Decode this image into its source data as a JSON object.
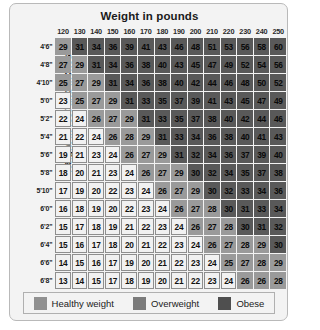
{
  "chart_data": {
    "type": "heatmap",
    "title": "Weight in pounds",
    "xlabel": "Weight in pounds",
    "ylabel": "Height in feet and inches",
    "grid": true,
    "legend_position": "bottom",
    "categories": [
      "120",
      "130",
      "140",
      "150",
      "160",
      "170",
      "180",
      "190",
      "200",
      "210",
      "220",
      "230",
      "240",
      "250"
    ],
    "rows": [
      "4'6\"",
      "4'8\"",
      "4'10\"",
      "5'0\"",
      "5'2\"",
      "5'4\"",
      "5'6\"",
      "5'8\"",
      "5'10\"",
      "6'0\"",
      "6'2\"",
      "6'4\"",
      "6'6\"",
      "6'8\""
    ],
    "series": [
      {
        "name": "4'6\"",
        "values": [
          29,
          31,
          34,
          36,
          39,
          41,
          43,
          46,
          48,
          51,
          53,
          56,
          58,
          60
        ]
      },
      {
        "name": "4'8\"",
        "values": [
          27,
          29,
          31,
          34,
          36,
          38,
          40,
          43,
          45,
          47,
          49,
          52,
          54,
          56
        ]
      },
      {
        "name": "4'10\"",
        "values": [
          25,
          27,
          29,
          31,
          34,
          36,
          38,
          40,
          42,
          44,
          46,
          48,
          50,
          52
        ]
      },
      {
        "name": "5'0\"",
        "values": [
          23,
          25,
          27,
          29,
          31,
          33,
          35,
          37,
          39,
          41,
          43,
          45,
          47,
          49
        ]
      },
      {
        "name": "5'2\"",
        "values": [
          22,
          24,
          26,
          27,
          29,
          31,
          33,
          35,
          37,
          38,
          40,
          42,
          44,
          46
        ]
      },
      {
        "name": "5'4\"",
        "values": [
          21,
          22,
          24,
          26,
          28,
          29,
          31,
          33,
          34,
          36,
          38,
          40,
          41,
          43
        ]
      },
      {
        "name": "5'6\"",
        "values": [
          19,
          21,
          23,
          24,
          26,
          27,
          29,
          31,
          32,
          34,
          36,
          37,
          39,
          40
        ]
      },
      {
        "name": "5'8\"",
        "values": [
          18,
          20,
          21,
          23,
          24,
          26,
          27,
          29,
          30,
          32,
          34,
          35,
          37,
          38
        ]
      },
      {
        "name": "5'10\"",
        "values": [
          17,
          19,
          20,
          22,
          23,
          24,
          26,
          27,
          29,
          30,
          32,
          33,
          34,
          36
        ]
      },
      {
        "name": "6'0\"",
        "values": [
          16,
          18,
          19,
          20,
          22,
          23,
          24,
          26,
          27,
          28,
          30,
          31,
          33,
          34
        ]
      },
      {
        "name": "6'2\"",
        "values": [
          15,
          17,
          18,
          19,
          21,
          22,
          23,
          24,
          26,
          27,
          28,
          30,
          31,
          32
        ]
      },
      {
        "name": "6'4\"",
        "values": [
          15,
          16,
          17,
          18,
          20,
          21,
          22,
          23,
          24,
          26,
          27,
          28,
          29,
          30
        ]
      },
      {
        "name": "6'6\"",
        "values": [
          14,
          15,
          16,
          17,
          19,
          20,
          21,
          22,
          23,
          24,
          25,
          27,
          28,
          29
        ]
      },
      {
        "name": "6'8\"",
        "values": [
          13,
          14,
          15,
          17,
          18,
          19,
          20,
          21,
          22,
          23,
          24,
          26,
          26,
          28
        ]
      }
    ],
    "category_thresholds": {
      "healthy_max": 24,
      "overweight_min": 25,
      "overweight_max": 29,
      "obese_min": 30
    },
    "colors": {
      "healthy": "#f1f1f1",
      "overweight": "#9a9a9a",
      "obese": "#595959"
    }
  },
  "legend": {
    "items": [
      {
        "label": "Healthy weight",
        "key": "healthy"
      },
      {
        "label": "Overweight",
        "key": "overweight"
      },
      {
        "label": "Obese",
        "key": "obese"
      }
    ]
  },
  "source": {
    "text": ""
  }
}
